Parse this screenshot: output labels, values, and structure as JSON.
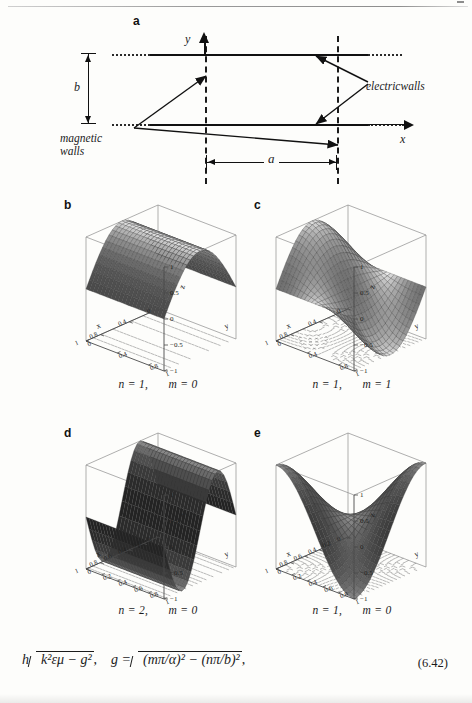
{
  "figure": {
    "panel_a": {
      "letter": "a",
      "axis_y": "y",
      "axis_x": "x",
      "dim_height": "b",
      "dim_width": "a",
      "label_electric": "electricwalls",
      "label_magnetic_line1": "magnetic",
      "label_magnetic_line2": "walls"
    },
    "panels": [
      {
        "letter": "b",
        "caption_n": "n = 1,",
        "caption_m": "m = 0",
        "zlabel": "z",
        "xlabel": "x",
        "ylabel": "y"
      },
      {
        "letter": "c",
        "caption_n": "n = 1,",
        "caption_m": "m = 1",
        "zlabel": "z",
        "xlabel": "x",
        "ylabel": "y"
      },
      {
        "letter": "d",
        "caption_n": "n = 2,",
        "caption_m": "m = 0",
        "zlabel": "z",
        "xlabel": "x",
        "ylabel": "y"
      },
      {
        "letter": "e",
        "caption_n": "n = 1,",
        "caption_m": "m = 0",
        "zlabel": "z",
        "xlabel": "x",
        "ylabel": "y"
      }
    ]
  },
  "equation": {
    "number": "(6.42)",
    "lhs_h": "h",
    "lhs_radicand": "k²εμ − g²",
    "comma": ",",
    "rhs_lead": "g  =",
    "rhs_radicand": "(mπ/α)² − (nπ/b)²",
    "tail": ","
  },
  "chart_data": [
    {
      "type": "surface",
      "panel": "b",
      "title": "n = 1,  m = 0",
      "xlabel": "x",
      "ylabel": "y",
      "zlabel": "z",
      "xlim": [
        0,
        1
      ],
      "ylim": [
        0,
        1
      ],
      "zlim": [
        -1,
        1
      ],
      "xticks": [
        0,
        0.4,
        0.8,
        1
      ],
      "yticks": [
        0,
        0.4,
        0.8,
        1
      ],
      "zticks": [
        1,
        0.5,
        0,
        -0.5,
        -1
      ],
      "function": "sin(pi*x)",
      "description": "half-sine ridge running along y, crest at x=0.5, value 1",
      "grid": true,
      "contour_base": true,
      "legend": "none"
    },
    {
      "type": "surface",
      "panel": "c",
      "title": "n = 1,  m = 1",
      "xlabel": "x",
      "ylabel": "y",
      "zlabel": "z",
      "xlim": [
        0,
        1
      ],
      "ylim": [
        0,
        1
      ],
      "zlim": [
        -1,
        1
      ],
      "xticks": [
        0,
        0.4,
        0.8,
        1
      ],
      "yticks": [
        0,
        0.4,
        0.8,
        1
      ],
      "zticks": [
        1,
        0.5,
        0,
        -0.5,
        -1
      ],
      "function": "sin(pi*x)*cos(pi*y)",
      "description": "saddle: positive lobe at y=0, negative lobe at y=1",
      "grid": true,
      "contour_base": true,
      "legend": "none"
    },
    {
      "type": "surface",
      "panel": "d",
      "title": "n = 2,  m = 0",
      "xlabel": "x",
      "ylabel": "y",
      "zlabel": "z",
      "xlim": [
        0,
        1
      ],
      "ylim": [
        0,
        1
      ],
      "zlim": [
        -1,
        1
      ],
      "xticks": [
        0,
        0.2,
        0.4,
        0.6,
        0.8,
        1
      ],
      "yticks": [
        0,
        0.2,
        0.4,
        0.6,
        0.8,
        1
      ],
      "zticks": [
        1,
        0.5,
        0,
        -0.5,
        -1
      ],
      "function": "sin(2*pi*x)",
      "description": "steep dark full-sine ramp, uniform along y",
      "grid": true,
      "contour_base": true,
      "legend": "none"
    },
    {
      "type": "surface",
      "panel": "e",
      "title": "n = 1,  m = 0",
      "xlabel": "x",
      "ylabel": "y",
      "zlabel": "z",
      "xlim": [
        0,
        1
      ],
      "ylim": [
        0,
        1
      ],
      "zlim": [
        -1,
        1
      ],
      "xticks": [
        0,
        0.2,
        0.4,
        0.6,
        0.8,
        1
      ],
      "yticks": [
        0,
        0.2,
        0.4,
        0.6,
        0.8,
        1
      ],
      "zticks": [
        1,
        0.5,
        0,
        -0.5,
        -1
      ],
      "function": "-cos(pi*x)*cos(pi*y)",
      "description": "valley / hyperbolic bowl, high corners, deep central trough",
      "grid": true,
      "contour_base": true,
      "legend": "none"
    }
  ]
}
